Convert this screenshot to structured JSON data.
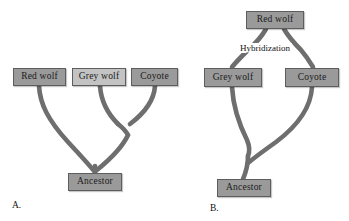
{
  "figure": {
    "background": "#ffffff",
    "branch_color": "#6e6e6e",
    "box_dark": "#9a9a9a",
    "box_light": "#c3c3c3",
    "box_border": "#5d5d5d"
  },
  "panels": [
    {
      "id": "A",
      "label": "A.",
      "nodes": {
        "red_wolf": "Red wolf",
        "grey_wolf": "Grey wolf",
        "coyote": "Coyote",
        "ancestor": "Ancestor"
      }
    },
    {
      "id": "B",
      "label": "B.",
      "nodes": {
        "red_wolf": "Red wolf",
        "grey_wolf": "Grey wolf",
        "coyote": "Coyote",
        "ancestor": "Ancestor"
      },
      "annotations": {
        "hybridization": "Hybridization"
      }
    }
  ]
}
